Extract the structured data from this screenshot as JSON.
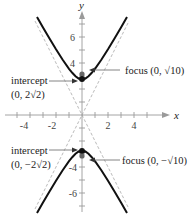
{
  "diagram": {
    "type": "hyperbola-graph",
    "equation_form": "y^2/8 - x^2/2 = 1",
    "axes": {
      "x_label": "x",
      "y_label": "y",
      "x_ticks": [
        "-4",
        "-2",
        "2",
        "4"
      ],
      "y_ticks": [
        "6",
        "4",
        "-4",
        "-6"
      ],
      "x_range": [
        -5,
        5
      ],
      "y_range": [
        -7,
        8
      ]
    },
    "annotations": {
      "upper_intercept_label": "intercept",
      "upper_intercept_coord": "(0, 2√2)",
      "upper_focus": "focus (0, √10)",
      "lower_intercept_label": "intercept",
      "lower_intercept_coord": "(0, −2√2)",
      "lower_focus": "focus (0, −√10)"
    },
    "colors": {
      "curve": "#111111",
      "axis": "#9a9a9a",
      "asymptote": "#9a9a9a",
      "focus_point": "#666666",
      "vertex_point": "#111111"
    }
  }
}
